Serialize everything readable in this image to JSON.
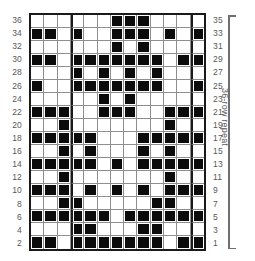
{
  "chart_data": {
    "type": "heatmap",
    "title": "",
    "xlabel": "",
    "ylabel": "",
    "columns": 13,
    "rows": 18,
    "grid_on": true,
    "legend_position": "none",
    "cell_values_note": "1 = filled (dark square), 0 = empty",
    "left_row_labels": [
      "36",
      "34",
      "32",
      "30",
      "28",
      "26",
      "24",
      "22",
      "20",
      "18",
      "16",
      "14",
      "12",
      "10",
      "8",
      "6",
      "4",
      "2"
    ],
    "right_row_labels": [
      "35",
      "33",
      "31",
      "29",
      "27",
      "25",
      "23",
      "21",
      "19",
      "17",
      "15",
      "13",
      "11",
      "9",
      "7",
      "5",
      "3",
      "1"
    ],
    "repeat_separator_columns": [
      3,
      12
    ],
    "cells": [
      [
        0,
        0,
        0,
        0,
        0,
        0,
        1,
        1,
        1,
        0,
        0,
        0,
        0
      ],
      [
        1,
        1,
        0,
        1,
        0,
        0,
        1,
        1,
        1,
        0,
        1,
        0,
        1
      ],
      [
        0,
        0,
        0,
        0,
        0,
        0,
        1,
        0,
        1,
        0,
        0,
        0,
        0
      ],
      [
        1,
        1,
        0,
        1,
        1,
        1,
        1,
        1,
        1,
        1,
        0,
        1,
        1
      ],
      [
        0,
        0,
        0,
        1,
        0,
        1,
        0,
        1,
        0,
        1,
        0,
        0,
        0
      ],
      [
        1,
        0,
        0,
        1,
        1,
        1,
        1,
        1,
        1,
        1,
        0,
        0,
        1
      ],
      [
        0,
        0,
        0,
        0,
        0,
        1,
        0,
        1,
        0,
        0,
        0,
        0,
        0
      ],
      [
        1,
        1,
        1,
        0,
        0,
        1,
        1,
        1,
        0,
        0,
        1,
        1,
        1
      ],
      [
        0,
        0,
        1,
        0,
        0,
        0,
        0,
        0,
        0,
        0,
        1,
        0,
        0
      ],
      [
        1,
        1,
        1,
        1,
        1,
        0,
        0,
        0,
        1,
        1,
        1,
        1,
        1
      ],
      [
        0,
        0,
        1,
        0,
        1,
        0,
        0,
        0,
        1,
        0,
        1,
        0,
        0
      ],
      [
        1,
        1,
        1,
        1,
        1,
        0,
        1,
        0,
        1,
        1,
        1,
        1,
        1
      ],
      [
        0,
        0,
        1,
        0,
        0,
        0,
        0,
        0,
        0,
        0,
        1,
        0,
        0
      ],
      [
        1,
        1,
        1,
        0,
        1,
        0,
        1,
        0,
        1,
        0,
        1,
        1,
        1
      ],
      [
        0,
        0,
        1,
        1,
        0,
        0,
        0,
        0,
        0,
        1,
        1,
        0,
        0
      ],
      [
        1,
        1,
        1,
        1,
        1,
        1,
        0,
        1,
        1,
        1,
        1,
        1,
        1
      ],
      [
        0,
        0,
        0,
        1,
        1,
        0,
        0,
        0,
        1,
        1,
        0,
        0,
        0
      ],
      [
        1,
        1,
        0,
        1,
        1,
        1,
        1,
        1,
        1,
        1,
        0,
        1,
        1
      ]
    ]
  },
  "annotations": {
    "repeat_label": "36-row repeat"
  }
}
